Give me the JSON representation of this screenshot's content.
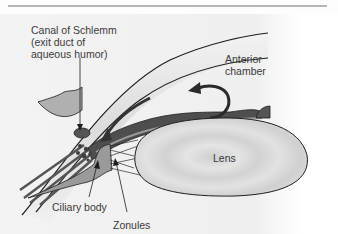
{
  "figure": {
    "labels": {
      "canal_of_schlemm": [
        "Canal of Schlemm",
        "(exit duct of",
        "aqueous humor)"
      ],
      "anterior_chamber": [
        "Anterior",
        "chamber"
      ],
      "lens": "Lens",
      "ciliary_body": "Ciliary body",
      "zonules": "Zonules"
    },
    "colors": {
      "outline": "#1e1e1e",
      "cornea_fill": "#e6e6e6",
      "sclera_fill": "#a8a8a8",
      "iris_fill": "#5a5a5a",
      "ciliary_fill": "#9a9a9a",
      "lens_fill": "#d9d9d9",
      "top_rule": "#6e6e6e"
    }
  }
}
